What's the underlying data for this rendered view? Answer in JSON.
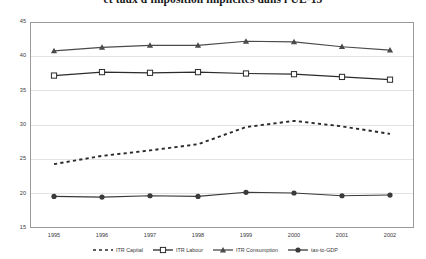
{
  "chart_data": {
    "type": "line",
    "title": "et taux d'imposition implicites dans l'UE-15",
    "xlabel": "",
    "ylabel": "",
    "x": [
      1995,
      1996,
      1997,
      1998,
      1999,
      2000,
      2001,
      2002
    ],
    "categories": [
      "1995",
      "1996",
      "1997",
      "1998",
      "1999",
      "2000",
      "2001",
      "2002"
    ],
    "ylim": [
      15,
      45
    ],
    "yticks": [
      15,
      20,
      25,
      30,
      35,
      40,
      45
    ],
    "ytick_labels": [
      "15",
      "20",
      "25",
      "30",
      "35",
      "40",
      "45"
    ],
    "grid": true,
    "legend_position": "bottom",
    "series": [
      {
        "name": "ITR Capital",
        "marker": "none",
        "linestyle": "dashed",
        "color": "#2b2b2b",
        "values": [
          24.3,
          25.5,
          26.3,
          27.2,
          29.7,
          30.6,
          29.8,
          28.7
        ]
      },
      {
        "name": "ITR Labour",
        "marker": "square",
        "linestyle": "solid",
        "color": "#2b2b2b",
        "values": [
          37.2,
          37.7,
          37.6,
          37.7,
          37.5,
          37.4,
          37.0,
          36.6
        ]
      },
      {
        "name": "ITR Consumption",
        "marker": "triangle",
        "linestyle": "solid",
        "color": "#4a4a4a",
        "values": [
          40.8,
          41.3,
          41.6,
          41.6,
          42.2,
          42.1,
          41.4,
          40.9
        ]
      },
      {
        "name": "tax-to-GDP",
        "marker": "circle",
        "linestyle": "solid",
        "color": "#3a3a3a",
        "values": [
          19.6,
          19.5,
          19.7,
          19.6,
          20.2,
          20.1,
          19.7,
          19.8
        ]
      }
    ]
  },
  "legend": {
    "items": [
      {
        "label": "ITR Capital"
      },
      {
        "label": "ITR Labour"
      },
      {
        "label": "ITR Consumption"
      },
      {
        "label": "tax-to-GDP"
      }
    ]
  }
}
